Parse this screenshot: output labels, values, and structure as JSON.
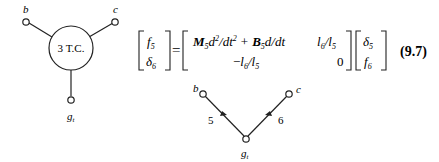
{
  "left_graph": {
    "center_label": "3 T.C.",
    "node_b": "b",
    "node_c": "c",
    "node_g": "g",
    "node_g_sub": "t"
  },
  "equation": {
    "lhs": [
      {
        "sym": "f",
        "sub": "5"
      },
      {
        "sym": "δ",
        "sub": "6"
      }
    ],
    "equals": "=",
    "matrix": {
      "r1c1": {
        "M": "M",
        "Msub": "5",
        "d2": "d",
        "d2sup": "2",
        "dt2": "/dt",
        "dt2sup": "2",
        "plus": "+",
        "B": "B",
        "Bsub": "5",
        "ddt": "d/dt"
      },
      "r1c2": {
        "l6": "l",
        "l6sub": "6",
        "slash": "/",
        "l5": "l",
        "l5sub": "5"
      },
      "r2c1": {
        "minus": "−",
        "l6": "l",
        "l6sub": "6",
        "slash": "/",
        "l5": "l",
        "l5sub": "5"
      },
      "r2c2": "0"
    },
    "rhs": [
      {
        "sym": "δ",
        "sub": "5"
      },
      {
        "sym": "f",
        "sub": "6"
      }
    ],
    "number": "(9.7)"
  },
  "right_graph": {
    "node_b": "b",
    "node_c": "c",
    "node_g": "g",
    "node_g_sub": "t",
    "edge_left": "5",
    "edge_right": "6"
  }
}
